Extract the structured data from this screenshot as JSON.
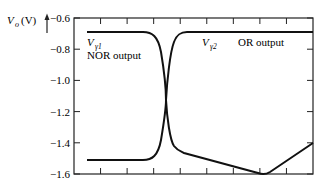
{
  "chart_data": {
    "type": "line",
    "title": "",
    "xlabel": "",
    "ylabel": "V_o (V)",
    "ylabel_parts": {
      "main": "V",
      "sub": "o",
      "unit": "(V)"
    },
    "ylim": [
      -1.6,
      -0.6
    ],
    "yticks": [
      -0.6,
      -0.8,
      -1.0,
      -1.2,
      -1.4,
      -1.6
    ],
    "ytick_labels": [
      "−0.6",
      "−0.8",
      "−1.0",
      "−1.2",
      "−1.4",
      "−1.6"
    ],
    "x_ticks_count": 9,
    "xtick_labels": [],
    "grid": false,
    "legend": null,
    "series": [
      {
        "name": "NOR output",
        "points": [
          [
            0.05,
            -0.69
          ],
          [
            0.28,
            -0.69
          ],
          [
            0.33,
            -0.72
          ],
          [
            0.36,
            -0.85
          ],
          [
            0.38,
            -1.1
          ],
          [
            0.4,
            -1.35
          ],
          [
            0.42,
            -1.44
          ],
          [
            0.45,
            -1.46
          ],
          [
            0.78,
            -1.59
          ],
          [
            0.82,
            -1.59
          ],
          [
            1.0,
            -1.4
          ]
        ]
      },
      {
        "name": "OR output",
        "points": [
          [
            0.05,
            -1.51
          ],
          [
            0.28,
            -1.51
          ],
          [
            0.32,
            -1.48
          ],
          [
            0.35,
            -1.35
          ],
          [
            0.38,
            -1.1
          ],
          [
            0.4,
            -0.85
          ],
          [
            0.42,
            -0.72
          ],
          [
            0.46,
            -0.69
          ],
          [
            1.0,
            -0.69
          ]
        ]
      }
    ],
    "annotations": [
      {
        "text": "V_γ1",
        "main": "V",
        "sub": "γ1"
      },
      {
        "text": "NOR output"
      },
      {
        "text": "V_γ2",
        "main": "V",
        "sub": "γ2"
      },
      {
        "text": "OR output"
      }
    ]
  }
}
